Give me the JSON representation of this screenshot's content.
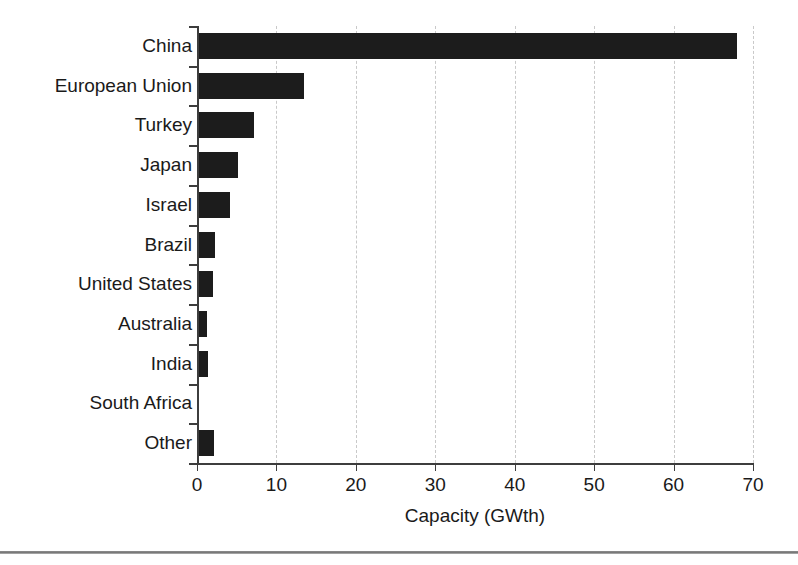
{
  "chart_data": {
    "type": "bar",
    "orientation": "horizontal",
    "title": "",
    "xlabel": "Capacity (GWth)",
    "ylabel": "",
    "xlim": [
      0,
      70
    ],
    "xticks": [
      0,
      10,
      20,
      30,
      40,
      50,
      60,
      70
    ],
    "xtick_labels": [
      "0",
      "10",
      "20",
      "30",
      "40",
      "50",
      "60",
      "70"
    ],
    "grid": "vertical-dashed",
    "legend": "none",
    "bar_color": "#1c1c1c",
    "grid_color": "#c9c9c9",
    "axis_color": "#3d3d3d",
    "categories": [
      "China",
      "European Union",
      "Turkey",
      "Japan",
      "Israel",
      "Brazil",
      "United States",
      "Australia",
      "India",
      "South Africa",
      "Other"
    ],
    "values": [
      68.0,
      13.5,
      7.2,
      5.1,
      4.1,
      2.3,
      2.0,
      1.3,
      1.4,
      0.0,
      2.1
    ]
  }
}
